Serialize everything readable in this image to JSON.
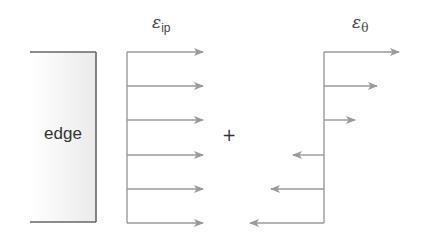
{
  "diagram": {
    "edge_block": {
      "label": "edge",
      "outline_color": "#666666",
      "fill_gradient": [
        "#ffffff",
        "#eaeaea"
      ]
    },
    "operator": "+",
    "arrow_color": "#9a9a9a",
    "left_field": {
      "symbol": "ε",
      "subscript": "ip",
      "description": "uniform in-plane strain",
      "arrows": [
        {
          "y": 52,
          "direction": "right",
          "length": 76
        },
        {
          "y": 86,
          "direction": "right",
          "length": 76
        },
        {
          "y": 120,
          "direction": "right",
          "length": 76
        },
        {
          "y": 155,
          "direction": "right",
          "length": 76
        },
        {
          "y": 189,
          "direction": "right",
          "length": 76
        },
        {
          "y": 223,
          "direction": "right",
          "length": 76
        }
      ]
    },
    "right_field": {
      "symbol": "ε",
      "subscript": "θ",
      "description": "linearly varying (bending) strain",
      "arrows": [
        {
          "y": 52,
          "direction": "right",
          "length": 75
        },
        {
          "y": 86,
          "direction": "right",
          "length": 53
        },
        {
          "y": 120,
          "direction": "right",
          "length": 31
        },
        {
          "y": 155,
          "direction": "left",
          "length": 31
        },
        {
          "y": 189,
          "direction": "left",
          "length": 53
        },
        {
          "y": 223,
          "direction": "left",
          "length": 74
        }
      ]
    }
  }
}
